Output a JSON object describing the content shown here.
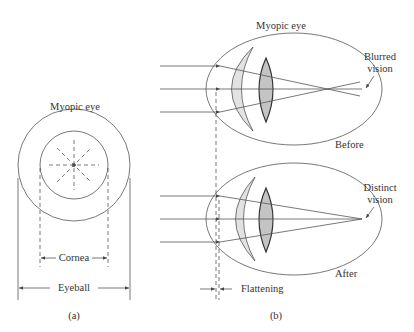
{
  "panel_a": {
    "title": "Myopic eye",
    "cornea_label": "Cornea",
    "eyeball_label": "Eyeball",
    "caption": "(a)"
  },
  "panel_b": {
    "title": "Myopic eye",
    "before_label": "Before",
    "after_label": "After",
    "blurred_label_1": "Blurred",
    "blurred_label_2": "vision",
    "distinct_label_1": "Distinct",
    "distinct_label_2": "vision",
    "flattening_label": "Flattening",
    "caption": "(b)"
  },
  "colors": {
    "line": "#444444",
    "cornea_fill": "#e2e2e2",
    "lens_fill": "#c4c4c4"
  }
}
